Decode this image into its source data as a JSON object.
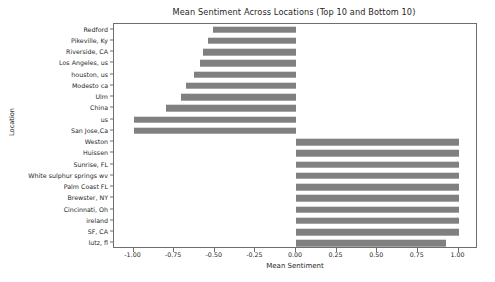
{
  "chart_data": {
    "type": "bar",
    "orientation": "horizontal",
    "title": "Mean Sentiment Across Locations (Top 10 and Bottom 10)",
    "xlabel": "Mean Sentiment",
    "ylabel": "Location",
    "xlim": [
      -1.12,
      1.12
    ],
    "xticks": [
      -1.0,
      -0.75,
      -0.5,
      -0.25,
      0.0,
      0.25,
      0.5,
      0.75,
      1.0
    ],
    "xticklabels": [
      "-1.00",
      "-0.75",
      "-0.50",
      "-0.25",
      "0.00",
      "0.25",
      "0.50",
      "0.75",
      "1.00"
    ],
    "grid": false,
    "legend": false,
    "bar_color": "#808080",
    "categories": [
      "Redford",
      "Pikeville, Ky",
      "Riverside, CA",
      "Los Angeles, us",
      "houston, us",
      "Modesto ca",
      "Ulm",
      "China",
      "us",
      "San Jose,Ca",
      "Weston",
      "Huissen",
      "Sunrise, FL",
      "White sulphur springs wv",
      "Palm Coast FL",
      "Brewster, NY",
      "Cincinnati, Oh",
      "ireland",
      "SF, CA",
      "lutz, fl"
    ],
    "values": [
      -0.51,
      -0.54,
      -0.57,
      -0.59,
      -0.63,
      -0.68,
      -0.71,
      -0.8,
      -1.0,
      -1.0,
      1.0,
      1.0,
      1.0,
      1.0,
      1.0,
      1.0,
      1.0,
      1.0,
      1.0,
      0.92
    ]
  }
}
